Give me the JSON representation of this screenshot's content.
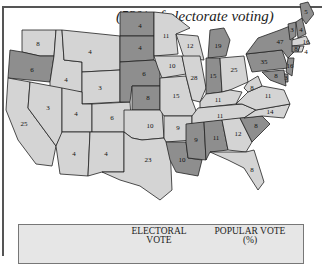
{
  "title": "(53% of electorate voting)",
  "legend": {
    "columns": [
      {
        "label_line1": "ELECTORAL",
        "label_line2": "VOTE"
      },
      {
        "label_line1": "POPULAR VOTE",
        "label_line2": "(%)"
      }
    ]
  },
  "colors": {
    "dark": "#8e8e8e",
    "light": "#d4d4d4",
    "border": "#222222"
  },
  "states": [
    {
      "name": "Washington",
      "ev": "8",
      "shade": "light"
    },
    {
      "name": "Oregon",
      "ev": "6",
      "shade": "dark"
    },
    {
      "name": "California",
      "ev": "25",
      "shade": "light"
    },
    {
      "name": "Idaho",
      "ev": "4",
      "shade": "light"
    },
    {
      "name": "Nevada",
      "ev": "3",
      "shade": "light"
    },
    {
      "name": "Montana",
      "ev": "4",
      "shade": "light"
    },
    {
      "name": "Wyoming",
      "ev": "3",
      "shade": "light"
    },
    {
      "name": "Utah",
      "ev": "4",
      "shade": "light"
    },
    {
      "name": "Colorado",
      "ev": "6",
      "shade": "light"
    },
    {
      "name": "Arizona",
      "ev": "4",
      "shade": "light"
    },
    {
      "name": "New Mexico",
      "ev": "4",
      "shade": "light"
    },
    {
      "name": "North Dakota",
      "ev": "4",
      "shade": "dark"
    },
    {
      "name": "South Dakota",
      "ev": "4",
      "shade": "dark"
    },
    {
      "name": "Nebraska",
      "ev": "6",
      "shade": "dark"
    },
    {
      "name": "Kansas",
      "ev": "8",
      "shade": "dark"
    },
    {
      "name": "Oklahoma",
      "ev": "10",
      "shade": "light"
    },
    {
      "name": "Texas",
      "ev": "23",
      "shade": "light"
    },
    {
      "name": "Minnesota",
      "ev": "11",
      "shade": "light"
    },
    {
      "name": "Iowa",
      "ev": "10",
      "shade": "light"
    },
    {
      "name": "Missouri",
      "ev": "15",
      "shade": "light"
    },
    {
      "name": "Arkansas",
      "ev": "9",
      "shade": "light"
    },
    {
      "name": "Louisiana",
      "ev": "10",
      "shade": "dark"
    },
    {
      "name": "Wisconsin",
      "ev": "12",
      "shade": "light"
    },
    {
      "name": "Illinois",
      "ev": "28",
      "shade": "light"
    },
    {
      "name": "Michigan",
      "ev": "19",
      "shade": "dark"
    },
    {
      "name": "Indiana",
      "ev": "15",
      "shade": "dark"
    },
    {
      "name": "Ohio",
      "ev": "25",
      "shade": "light"
    },
    {
      "name": "Kentucky",
      "ev": "11",
      "shade": "light"
    },
    {
      "name": "Tennessee",
      "ev": "11",
      "shade": "light"
    },
    {
      "name": "Mississippi",
      "ev": "9",
      "shade": "dark"
    },
    {
      "name": "Alabama",
      "ev": "11",
      "shade": "dark"
    },
    {
      "name": "Georgia",
      "ev": "12",
      "shade": "light"
    },
    {
      "name": "Florida",
      "ev": "8",
      "shade": "light"
    },
    {
      "name": "South Carolina",
      "ev": "8",
      "shade": "dark"
    },
    {
      "name": "North Carolina",
      "ev": "14",
      "shade": "light"
    },
    {
      "name": "Virginia",
      "ev": "11",
      "shade": "light"
    },
    {
      "name": "West Virginia",
      "ev": "8",
      "shade": "light"
    },
    {
      "name": "Pennsylvania",
      "ev": "35",
      "shade": "dark"
    },
    {
      "name": "New York",
      "ev": "47",
      "shade": "dark"
    },
    {
      "name": "Vermont",
      "ev": "3",
      "shade": "dark"
    },
    {
      "name": "New Hampshire",
      "ev": "4",
      "shade": "dark"
    },
    {
      "name": "Maine",
      "ev": "5",
      "shade": "dark"
    },
    {
      "name": "Massachusetts",
      "ev": "16",
      "shade": "light"
    },
    {
      "name": "Connecticut",
      "ev": "8",
      "shade": "dark"
    },
    {
      "name": "Rhode Island",
      "ev": "4",
      "shade": "light"
    },
    {
      "name": "New Jersey",
      "ev": "16",
      "shade": "dark"
    },
    {
      "name": "Delaware",
      "ev": "3",
      "shade": "dark"
    },
    {
      "name": "Maryland",
      "ev": "8",
      "shade": "dark"
    }
  ]
}
